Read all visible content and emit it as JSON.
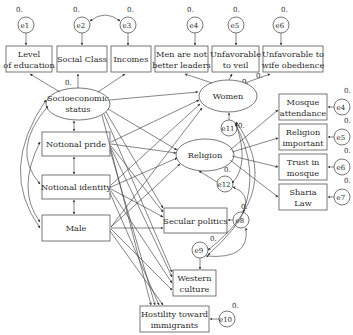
{
  "diagram": {
    "latent": {
      "ses": {
        "line1": "Socioeconomic",
        "line2": "status",
        "var": "0."
      },
      "women": {
        "label": "Women",
        "var": "0."
      },
      "religion": {
        "label": "Religion"
      }
    },
    "indicators": {
      "education": {
        "line1": "Level",
        "line2": "of education"
      },
      "social_class": {
        "label": "Social Class"
      },
      "incomes": {
        "label": "Incomes"
      },
      "men_leaders": {
        "line1": "Men are not",
        "line2": "better leaders"
      },
      "veil": {
        "line1": "Unfavorable",
        "line2": "to veil"
      },
      "obedience": {
        "line1": "Unfavorable to",
        "line2": "wife obedience"
      },
      "mosque_att": {
        "line1": "Mosque",
        "line2": "attendance"
      },
      "rel_important": {
        "line1": "Religion",
        "line2": "important"
      },
      "trust_mosque": {
        "line1": "Trust in",
        "line2": "mosque"
      },
      "sharia": {
        "line1": "Sharia",
        "line2": "Law"
      }
    },
    "exogenous": {
      "pride": {
        "label": "Notional pride"
      },
      "identity": {
        "label": "Notional identity"
      },
      "male": {
        "label": "Male"
      }
    },
    "outcomes": {
      "secular": {
        "label": "Secular politics"
      },
      "western": {
        "line1": "Western",
        "line2": "culture"
      },
      "hostility": {
        "line1": "Hostility toward",
        "line2": "immigrants"
      }
    },
    "errors": {
      "e1": "e1",
      "e2": "e2",
      "e3": "e3",
      "e4": "e4",
      "e5": "e5",
      "e6": "e6",
      "e4r": "e4",
      "e5r": "e5",
      "e6r": "e6",
      "e7": "e7",
      "e8": "e8",
      "e9": "e9",
      "e10": "e10",
      "e11": "e11",
      "e12": "e12"
    },
    "variance_label": "0."
  }
}
